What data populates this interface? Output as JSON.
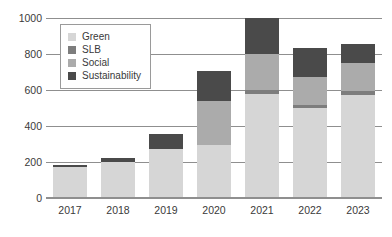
{
  "chart_data": {
    "type": "bar",
    "stacked": true,
    "title": "",
    "subtitle": "",
    "xlabel": "",
    "ylabel": "",
    "categories": [
      "2017",
      "2018",
      "2019",
      "2020",
      "2021",
      "2022",
      "2023"
    ],
    "series": [
      {
        "name": "Green",
        "color": "#d6d6d6",
        "values": [
          170,
          198,
          272,
          296,
          580,
          500,
          575
        ]
      },
      {
        "name": "SLB",
        "color": "#7d7d7d",
        "values": [
          0,
          0,
          0,
          0,
          18,
          15,
          20
        ]
      },
      {
        "name": "Social",
        "color": "#ababab",
        "values": [
          0,
          0,
          0,
          245,
          202,
          155,
          155
        ]
      },
      {
        "name": "Sustainability",
        "color": "#4a4a4a",
        "values": [
          15,
          22,
          82,
          164,
          200,
          165,
          105
        ]
      }
    ],
    "totals": [
      185,
      220,
      354,
      705,
      1000,
      835,
      855
    ],
    "ylim": [
      0,
      1000
    ],
    "yticks": [
      "0",
      "200",
      "400",
      "600",
      "800",
      "1000"
    ],
    "ytick_values": [
      0,
      200,
      400,
      600,
      800,
      1000
    ],
    "grid": true,
    "legend_position": "upper-left",
    "legend_entries": [
      "Green",
      "SLB",
      "Social",
      "Sustainability"
    ]
  }
}
